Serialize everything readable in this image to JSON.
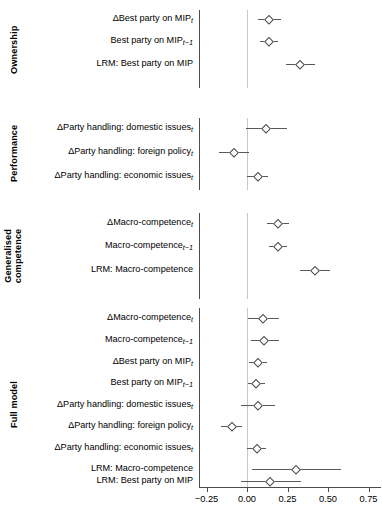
{
  "chart_data": {
    "type": "scatter",
    "plot_style": "forest-plot / coefficient plot with 95% confidence intervals",
    "title": "",
    "xlabel": "",
    "ylabel": "",
    "xlim": [
      -0.375,
      0.84
    ],
    "xticks": [
      -0.25,
      0.0,
      0.25,
      0.5,
      0.75
    ],
    "xticklabels": [
      "−0.25",
      "0.00",
      "0.25",
      "0.50",
      "0.75"
    ],
    "grid": false,
    "zero_reference_line": 0.0,
    "legend": null,
    "marker_shape": "open-diamond",
    "groups": [
      {
        "name": "Ownership",
        "rows": [
          {
            "label_html": "ΔBest party on MIP<sub>t</sub>",
            "label_text": "ΔBest party on MIP_t",
            "estimate": 0.135,
            "ci_low": 0.068,
            "ci_high": 0.208
          },
          {
            "label_html": "Best party on MIP<sub>t−1</sub>",
            "label_text": "Best party on MIP_t−1",
            "estimate": 0.135,
            "ci_low": 0.082,
            "ci_high": 0.19
          },
          {
            "label_html": "LRM: Best party on MIP",
            "label_text": "LRM: Best party on MIP",
            "estimate": 0.33,
            "ci_low": 0.243,
            "ci_high": 0.42
          }
        ]
      },
      {
        "name": "Performance",
        "rows": [
          {
            "label_html": "ΔParty handling: domestic issues<sub>t</sub>",
            "label_text": "ΔParty handling: domestic issues_t",
            "estimate": 0.118,
            "ci_low": -0.008,
            "ci_high": 0.25
          },
          {
            "label_html": "ΔParty handling: foreign policy<sub>t</sub>",
            "label_text": "ΔParty handling: foreign policy_t",
            "estimate": -0.08,
            "ci_low": -0.175,
            "ci_high": 0.013
          },
          {
            "label_html": "ΔParty handling: economic issues<sub>t</sub>",
            "label_text": "ΔParty handling: economic issues_t",
            "estimate": 0.065,
            "ci_low": 0.0,
            "ci_high": 0.13
          }
        ]
      },
      {
        "name": "Generalised competence",
        "name_lines": [
          "Generalised",
          "competence"
        ],
        "rows": [
          {
            "label_html": "ΔMacro-competence<sub>t</sub>",
            "label_text": "ΔMacro-competence_t",
            "estimate": 0.192,
            "ci_low": 0.125,
            "ci_high": 0.262
          },
          {
            "label_html": "Macro-competence<sub>t−1</sub>",
            "label_text": "Macro-competence_t−1",
            "estimate": 0.19,
            "ci_low": 0.137,
            "ci_high": 0.245
          },
          {
            "label_html": "LRM: Macro-competence",
            "label_text": "LRM: Macro-competence",
            "estimate": 0.422,
            "ci_low": 0.33,
            "ci_high": 0.515
          }
        ]
      },
      {
        "name": "Full model",
        "rows": [
          {
            "label_html": "ΔMacro-competence<sub>t</sub>",
            "label_text": "ΔMacro-competence_t",
            "estimate": 0.1,
            "ci_low": 0.005,
            "ci_high": 0.195
          },
          {
            "label_html": "Macro-competence<sub>t−1</sub>",
            "label_text": "Macro-competence_t−1",
            "estimate": 0.108,
            "ci_low": 0.025,
            "ci_high": 0.195
          },
          {
            "label_html": "ΔBest party on MIP<sub>t</sub>",
            "label_text": "ΔBest party on MIP_t",
            "estimate": 0.068,
            "ci_low": 0.01,
            "ci_high": 0.123
          },
          {
            "label_html": "Best party on MIP<sub>t−1</sub>",
            "label_text": "Best party on MIP_t−1",
            "estimate": 0.057,
            "ci_low": 0.008,
            "ci_high": 0.11
          },
          {
            "label_html": "ΔParty handling: domestic issues<sub>t</sub>",
            "label_text": "ΔParty handling: domestic issues_t",
            "estimate": 0.065,
            "ci_low": -0.04,
            "ci_high": 0.172
          },
          {
            "label_html": "ΔParty handling: foreign policy<sub>t</sub>",
            "label_text": "ΔParty handling: foreign policy_t",
            "estimate": -0.095,
            "ci_low": -0.16,
            "ci_high": -0.03
          },
          {
            "label_html": "ΔParty handling: economic issues<sub>t</sub>",
            "label_text": "ΔParty handling: economic issues_t",
            "estimate": 0.06,
            "ci_low": 0.0,
            "ci_high": 0.12
          },
          {
            "label_html": "LRM: Macro-competence",
            "label_text": "LRM: Macro-competence",
            "estimate": 0.305,
            "ci_low": 0.033,
            "ci_high": 0.578
          },
          {
            "label_html": "LRM: Best party on MIP",
            "label_text": "LRM: Best party on MIP",
            "estimate": 0.145,
            "ci_low": -0.035,
            "ci_high": 0.335
          }
        ]
      }
    ]
  }
}
